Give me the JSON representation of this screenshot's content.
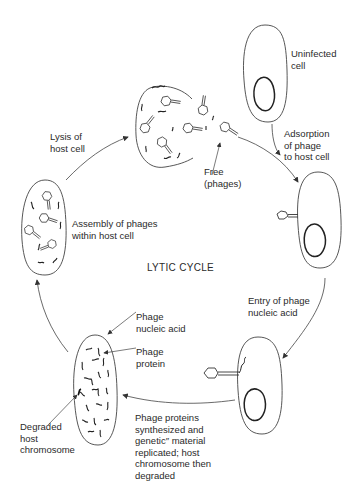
{
  "title": "LYTIC CYCLE",
  "stages": [
    {
      "id": "uninfected",
      "label": "Uninfected\ncell"
    },
    {
      "id": "adsorption",
      "label": "Adsorption\nof phage\nto host cell"
    },
    {
      "id": "entry",
      "label": "Entry of phage\nnucleic acid"
    },
    {
      "id": "synthesis",
      "label": "Phage proteins\nsynthesized and\ngenetic″ material\nreplicated; host\nchromosome then\ndegraded"
    },
    {
      "id": "assembly",
      "label": "Assembly of phages\nwithin host cell"
    },
    {
      "id": "lysis",
      "label": "Lysis of\nhost cell"
    }
  ],
  "annotations": {
    "free_phages": "Free\n(phages)",
    "phage_nucleic_acid": "Phage\nnucleic acid",
    "phage_protein": "Phage\nprotein",
    "degraded_host_chromosome": "Degraded\nhost\nchromosome"
  },
  "colors": {
    "line": "#333333",
    "background": "#ffffff"
  }
}
